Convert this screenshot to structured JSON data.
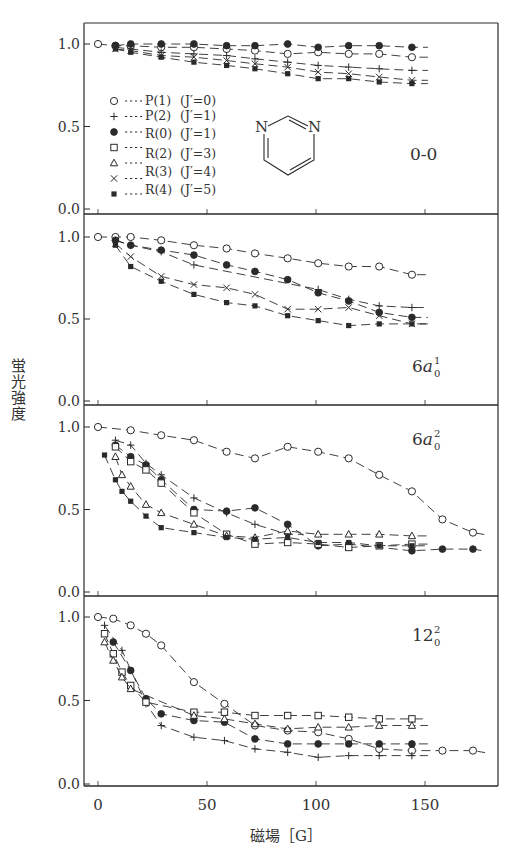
{
  "chart_data": {
    "type": "scatter",
    "title": "",
    "xlabel": "磁場 [G]",
    "ylabel": "蛍光強度",
    "xlim": [
      -8,
      183
    ],
    "ylim": [
      0,
      1.08
    ],
    "x_ticks": [
      0,
      50,
      100,
      150
    ],
    "y_ticks": [
      "0.0",
      "0.5",
      "1.0"
    ],
    "grid": false,
    "legend_position": "inside top-left of first panel",
    "legend": [
      {
        "marker": "open-circle",
        "label": "P(1)",
        "jprime": "(J′=0)"
      },
      {
        "marker": "plus",
        "label": "P(2)",
        "jprime": "(J′=1)"
      },
      {
        "marker": "filled-circle",
        "label": "R(0)",
        "jprime": "(J′=1)"
      },
      {
        "marker": "open-square",
        "label": "R(2)",
        "jprime": "(J′=3)"
      },
      {
        "marker": "open-triangle",
        "label": "R(3)",
        "jprime": "(J′=4)"
      },
      {
        "marker": "cross",
        "label": "R(3)",
        "jprime": "(J′=4)"
      },
      {
        "marker": "filled-square",
        "label": "R(4)",
        "jprime": "(J′=5)"
      }
    ],
    "molecule_inset": "pyrimidine",
    "panels": [
      {
        "label": "0-0",
        "label_sup": "",
        "label_sub": "",
        "series": [
          {
            "name": "P(1)",
            "marker": "open-circle",
            "x": [
              0,
              8,
              15,
              29,
              44,
              59,
              72,
              87,
              101,
              115,
              129,
              144
            ],
            "y": [
              1.0,
              0.99,
              0.99,
              0.98,
              0.98,
              0.97,
              0.96,
              0.94,
              0.95,
              0.94,
              0.94,
              0.92
            ]
          },
          {
            "name": "P(2)",
            "marker": "plus",
            "x": [
              8,
              15,
              29,
              44,
              59,
              72,
              87,
              101,
              115,
              129,
              144
            ],
            "y": [
              0.98,
              0.97,
              0.95,
              0.94,
              0.93,
              0.91,
              0.89,
              0.87,
              0.86,
              0.85,
              0.84
            ]
          },
          {
            "name": "R(0)",
            "marker": "filled-circle",
            "x": [
              8,
              15,
              29,
              44,
              59,
              72,
              87,
              101,
              115,
              129,
              144
            ],
            "y": [
              0.99,
              1.0,
              1.0,
              1.0,
              0.99,
              0.99,
              1.0,
              0.98,
              0.99,
              0.99,
              0.98
            ]
          },
          {
            "name": "R(3)",
            "marker": "cross",
            "x": [
              8,
              15,
              29,
              44,
              59,
              72,
              87,
              101,
              115,
              129,
              144
            ],
            "y": [
              0.97,
              0.96,
              0.93,
              0.92,
              0.9,
              0.88,
              0.86,
              0.83,
              0.82,
              0.8,
              0.78
            ]
          },
          {
            "name": "R(4)",
            "marker": "filled-square",
            "x": [
              8,
              15,
              29,
              44,
              59,
              72,
              87,
              101,
              115,
              129,
              144
            ],
            "y": [
              0.97,
              0.95,
              0.92,
              0.89,
              0.87,
              0.85,
              0.82,
              0.79,
              0.79,
              0.77,
              0.76
            ]
          }
        ]
      },
      {
        "label": "6a",
        "label_sup": "1",
        "label_sub": "0",
        "series": [
          {
            "name": "P(1)",
            "marker": "open-circle",
            "x": [
              0,
              8,
              15,
              29,
              44,
              59,
              72,
              87,
              101,
              115,
              129,
              144
            ],
            "y": [
              1.0,
              1.0,
              1.0,
              0.98,
              0.95,
              0.93,
              0.9,
              0.87,
              0.84,
              0.82,
              0.82,
              0.77
            ]
          },
          {
            "name": "P(2)",
            "marker": "plus",
            "x": [
              8,
              15,
              29,
              44,
              101,
              115,
              129,
              144
            ],
            "y": [
              0.98,
              0.95,
              0.91,
              0.83,
              0.68,
              0.62,
              0.58,
              0.57
            ]
          },
          {
            "name": "R(0)",
            "marker": "filled-circle",
            "x": [
              8,
              15,
              29,
              44,
              59,
              72,
              87,
              101,
              115,
              129,
              144
            ],
            "y": [
              0.98,
              0.95,
              0.92,
              0.89,
              0.83,
              0.79,
              0.74,
              0.66,
              0.61,
              0.54,
              0.51
            ]
          },
          {
            "name": "R(3)",
            "marker": "cross",
            "x": [
              8,
              15,
              29,
              44,
              59,
              72,
              87,
              101,
              115,
              129,
              144
            ],
            "y": [
              0.96,
              0.88,
              0.76,
              0.71,
              0.69,
              0.65,
              0.56,
              0.56,
              0.57,
              0.52,
              0.47
            ]
          },
          {
            "name": "R(4)",
            "marker": "filled-square",
            "x": [
              8,
              15,
              29,
              44,
              59,
              72,
              87,
              101,
              115,
              129,
              144
            ],
            "y": [
              0.95,
              0.82,
              0.73,
              0.65,
              0.6,
              0.58,
              0.52,
              0.49,
              0.46,
              0.47,
              0.47
            ]
          }
        ]
      },
      {
        "label": "6a",
        "label_sup": "2",
        "label_sub": "0",
        "series": [
          {
            "name": "P(1)",
            "marker": "open-circle",
            "x": [
              0,
              15,
              29,
              44,
              59,
              72,
              87,
              101,
              115,
              129,
              144,
              158,
              172
            ],
            "y": [
              1.0,
              0.98,
              0.95,
              0.92,
              0.85,
              0.81,
              0.88,
              0.85,
              0.81,
              0.71,
              0.61,
              0.44,
              0.36
            ]
          },
          {
            "name": "P(2)",
            "marker": "plus",
            "x": [
              8,
              15,
              22,
              29,
              44,
              59,
              72,
              87
            ],
            "y": [
              0.92,
              0.89,
              0.78,
              0.71,
              0.57,
              0.48,
              0.41,
              0.35
            ]
          },
          {
            "name": "R(0)",
            "marker": "filled-circle",
            "x": [
              8,
              15,
              22,
              29,
              44,
              59,
              72,
              87,
              101,
              115,
              144,
              158,
              172
            ],
            "y": [
              0.89,
              0.82,
              0.77,
              0.68,
              0.5,
              0.49,
              0.51,
              0.41,
              0.28,
              0.29,
              0.25,
              0.26,
              0.26
            ]
          },
          {
            "name": "R(2)",
            "marker": "open-square",
            "x": [
              8,
              15,
              22,
              29,
              44,
              59,
              72,
              87,
              101,
              115,
              129,
              144
            ],
            "y": [
              0.88,
              0.79,
              0.74,
              0.66,
              0.48,
              0.35,
              0.29,
              0.3,
              0.29,
              0.27,
              0.28,
              0.29
            ]
          },
          {
            "name": "R(3) triangle",
            "marker": "open-triangle",
            "x": [
              8,
              11,
              15,
              22,
              29,
              44,
              59,
              72,
              87,
              101,
              115,
              129,
              144
            ],
            "y": [
              0.82,
              0.71,
              0.64,
              0.53,
              0.48,
              0.41,
              0.34,
              0.33,
              0.37,
              0.35,
              0.35,
              0.35,
              0.34
            ]
          },
          {
            "name": "R(4)",
            "marker": "filled-square",
            "x": [
              3,
              8,
              11,
              15,
              22,
              29,
              44,
              59,
              72,
              87,
              101,
              115,
              129,
              144
            ],
            "y": [
              0.83,
              0.68,
              0.61,
              0.55,
              0.46,
              0.39,
              0.36,
              0.33,
              0.32,
              0.33,
              0.3,
              0.3,
              0.28,
              0.28
            ]
          }
        ]
      },
      {
        "label": "12",
        "label_sup": "2",
        "label_sub": "0",
        "series": [
          {
            "name": "P(1)",
            "marker": "open-circle",
            "x": [
              0,
              7,
              15,
              22,
              29,
              44,
              58,
              72,
              87,
              101,
              115,
              129,
              144,
              158,
              172
            ],
            "y": [
              1.0,
              0.99,
              0.95,
              0.9,
              0.83,
              0.61,
              0.48,
              0.35,
              0.32,
              0.31,
              0.27,
              0.21,
              0.2,
              0.2,
              0.2
            ]
          },
          {
            "name": "P(2)",
            "marker": "plus",
            "x": [
              3,
              11,
              22,
              29,
              44,
              58,
              72,
              87,
              101,
              115,
              129,
              144
            ],
            "y": [
              0.95,
              0.8,
              0.48,
              0.35,
              0.28,
              0.26,
              0.21,
              0.19,
              0.16,
              0.17,
              0.17,
              0.17
            ]
          },
          {
            "name": "R(0)",
            "marker": "filled-circle",
            "x": [
              7,
              15,
              22,
              29,
              44,
              58,
              72,
              87,
              101,
              115,
              129,
              144
            ],
            "y": [
              0.85,
              0.68,
              0.51,
              0.42,
              0.38,
              0.37,
              0.27,
              0.24,
              0.24,
              0.24,
              0.24,
              0.24
            ]
          },
          {
            "name": "R(2)",
            "marker": "open-square",
            "x": [
              3,
              7,
              11,
              15,
              22,
              44,
              58,
              72,
              87,
              101,
              115,
              129,
              144
            ],
            "y": [
              0.9,
              0.78,
              0.67,
              0.59,
              0.49,
              0.43,
              0.43,
              0.41,
              0.41,
              0.41,
              0.4,
              0.39,
              0.39
            ]
          },
          {
            "name": "R(3) triangle",
            "marker": "open-triangle",
            "x": [
              3,
              7,
              11,
              15,
              44,
              58,
              72,
              87,
              101,
              115,
              129,
              144
            ],
            "y": [
              0.85,
              0.74,
              0.64,
              0.57,
              0.41,
              0.39,
              0.36,
              0.33,
              0.34,
              0.34,
              0.35,
              0.35
            ]
          }
        ]
      }
    ]
  },
  "axes": {
    "x_tick_labels": [
      "0",
      "50",
      "100",
      "150"
    ],
    "y_tick_labels": [
      "0.0",
      "0.5",
      "1.0"
    ],
    "xlabel": "磁場［G］",
    "ylabel": "蛍光強度"
  },
  "legend_rows": [
    {
      "label": "P(1)",
      "jprime": "(J′=0)"
    },
    {
      "label": "P(2)",
      "jprime": "(J′=1)"
    },
    {
      "label": "R(0)",
      "jprime": "(J′=1)"
    },
    {
      "label": "R(2)",
      "jprime": "(J′=3)"
    },
    {
      "label": "R(2)",
      "jprime": "(J′=3)"
    },
    {
      "label": "R(3)",
      "jprime": "(J′=4)"
    },
    {
      "label": "R(4)",
      "jprime": "(J′=5)"
    }
  ],
  "molecule": {
    "atom1": "N",
    "atom2": "N"
  }
}
